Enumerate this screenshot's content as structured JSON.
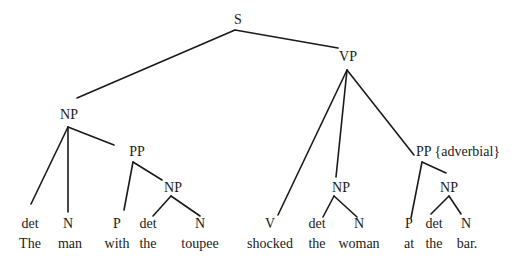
{
  "diagram": {
    "type": "syntax-parse-tree",
    "nodes": [
      {
        "id": "S",
        "label": "S",
        "x": 238,
        "y": 24
      },
      {
        "id": "NP1",
        "label": "NP",
        "x": 69,
        "y": 119
      },
      {
        "id": "VP",
        "label": "VP",
        "x": 348,
        "y": 61
      },
      {
        "id": "PP1",
        "label": "PP",
        "x": 137,
        "y": 156
      },
      {
        "id": "NP2",
        "label": "NP",
        "x": 173,
        "y": 192
      },
      {
        "id": "NP3",
        "label": "NP",
        "x": 341,
        "y": 192
      },
      {
        "id": "PP2",
        "label": "PP {adverbial}",
        "x": 458,
        "y": 156
      },
      {
        "id": "NP4",
        "label": "NP",
        "x": 449,
        "y": 192
      },
      {
        "id": "t1",
        "label": "det",
        "x": 30,
        "y": 228
      },
      {
        "id": "t2",
        "label": "N",
        "x": 68,
        "y": 228
      },
      {
        "id": "t3",
        "label": "P",
        "x": 117,
        "y": 228
      },
      {
        "id": "t4",
        "label": "det",
        "x": 148,
        "y": 228
      },
      {
        "id": "t5",
        "label": "N",
        "x": 200,
        "y": 228
      },
      {
        "id": "t6",
        "label": "V",
        "x": 270,
        "y": 228
      },
      {
        "id": "t7",
        "label": "det",
        "x": 317,
        "y": 228
      },
      {
        "id": "t8",
        "label": "N",
        "x": 359,
        "y": 228
      },
      {
        "id": "t9",
        "label": "P",
        "x": 409,
        "y": 228
      },
      {
        "id": "t10",
        "label": "det",
        "x": 434,
        "y": 228
      },
      {
        "id": "t11",
        "label": "N",
        "x": 466,
        "y": 228
      }
    ],
    "words": [
      {
        "text": "The",
        "x": 30
      },
      {
        "text": "man",
        "x": 70
      },
      {
        "text": "with",
        "x": 117
      },
      {
        "text": "the",
        "x": 148
      },
      {
        "text": "toupee",
        "x": 200
      },
      {
        "text": "shocked",
        "x": 270
      },
      {
        "text": "the",
        "x": 317
      },
      {
        "text": "woman",
        "x": 359
      },
      {
        "text": "at",
        "x": 409
      },
      {
        "text": "the",
        "x": 434
      },
      {
        "text": "bar.",
        "x": 467
      }
    ],
    "words_y": 248,
    "edges": [
      [
        235,
        30,
        77,
        98
      ],
      [
        235,
        30,
        338,
        48
      ],
      [
        68,
        127,
        31,
        204
      ],
      [
        68,
        127,
        68,
        212
      ],
      [
        68,
        127,
        114,
        145
      ],
      [
        133,
        162,
        124,
        210
      ],
      [
        133,
        162,
        162,
        180
      ],
      [
        171,
        196,
        153,
        216
      ],
      [
        171,
        196,
        200,
        216
      ],
      [
        347,
        70,
        278,
        215
      ],
      [
        347,
        70,
        336,
        177
      ],
      [
        347,
        70,
        414,
        155
      ],
      [
        334,
        196,
        323,
        217
      ],
      [
        334,
        196,
        357,
        217
      ],
      [
        422,
        162,
        411,
        218
      ],
      [
        422,
        162,
        446,
        173
      ],
      [
        449,
        196,
        431,
        214
      ],
      [
        449,
        196,
        461,
        214
      ]
    ]
  }
}
